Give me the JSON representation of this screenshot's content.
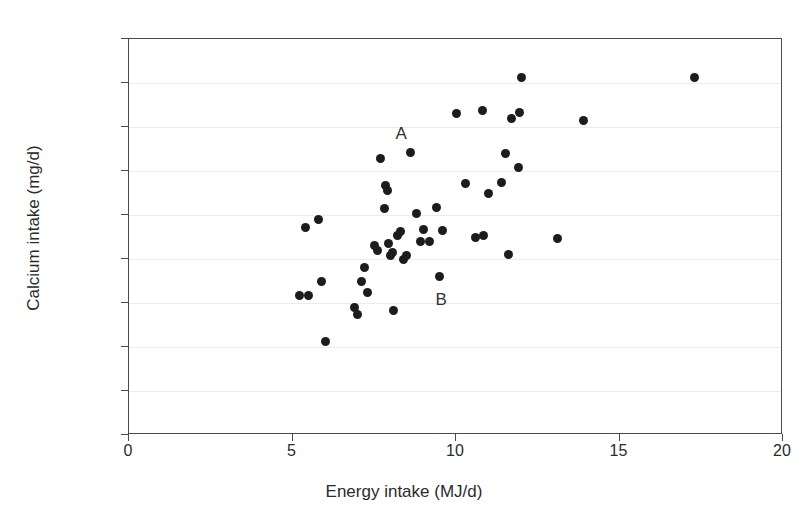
{
  "chart_data": {
    "type": "scatter",
    "title": "",
    "xlabel": "Energy intake (MJ/d)",
    "ylabel": "Calcium intake (mg/d)",
    "xlim": [
      0,
      20
    ],
    "ylim": [
      0,
      1800
    ],
    "xticks": [
      0,
      5,
      10,
      15,
      20
    ],
    "yticks": [
      0,
      200,
      400,
      600,
      800,
      1000,
      1200,
      1400,
      1600,
      1800
    ],
    "grid": "horizontal",
    "legend": "none",
    "marker": "filled-circle",
    "marker_color": "#1c1c1c",
    "points": [
      {
        "x": 5.2,
        "y": 635
      },
      {
        "x": 5.4,
        "y": 945
      },
      {
        "x": 5.5,
        "y": 635
      },
      {
        "x": 5.8,
        "y": 980
      },
      {
        "x": 5.9,
        "y": 700
      },
      {
        "x": 6.0,
        "y": 425
      },
      {
        "x": 6.9,
        "y": 580
      },
      {
        "x": 7.0,
        "y": 550
      },
      {
        "x": 7.1,
        "y": 700
      },
      {
        "x": 7.2,
        "y": 760
      },
      {
        "x": 7.3,
        "y": 650
      },
      {
        "x": 7.5,
        "y": 860
      },
      {
        "x": 7.6,
        "y": 840
      },
      {
        "x": 7.7,
        "y": 1255
      },
      {
        "x": 7.8,
        "y": 1030
      },
      {
        "x": 7.85,
        "y": 1135
      },
      {
        "x": 7.9,
        "y": 1110
      },
      {
        "x": 7.95,
        "y": 870
      },
      {
        "x": 8.0,
        "y": 815
      },
      {
        "x": 8.05,
        "y": 830
      },
      {
        "x": 8.1,
        "y": 565
      },
      {
        "x": 8.2,
        "y": 905
      },
      {
        "x": 8.3,
        "y": 925
      },
      {
        "x": 8.4,
        "y": 800
      },
      {
        "x": 8.5,
        "y": 815
      },
      {
        "x": 8.6,
        "y": 1285
      },
      {
        "x": 8.8,
        "y": 1005
      },
      {
        "x": 8.9,
        "y": 880
      },
      {
        "x": 9.0,
        "y": 935
      },
      {
        "x": 9.2,
        "y": 880
      },
      {
        "x": 9.4,
        "y": 1035
      },
      {
        "x": 9.5,
        "y": 720
      },
      {
        "x": 9.6,
        "y": 930
      },
      {
        "x": 10.0,
        "y": 1460
      },
      {
        "x": 10.3,
        "y": 1145
      },
      {
        "x": 10.6,
        "y": 900
      },
      {
        "x": 10.8,
        "y": 1475
      },
      {
        "x": 10.85,
        "y": 905
      },
      {
        "x": 11.0,
        "y": 1100
      },
      {
        "x": 11.4,
        "y": 1150
      },
      {
        "x": 11.5,
        "y": 1280
      },
      {
        "x": 11.6,
        "y": 820
      },
      {
        "x": 11.7,
        "y": 1440
      },
      {
        "x": 11.9,
        "y": 1215
      },
      {
        "x": 11.95,
        "y": 1465
      },
      {
        "x": 12.0,
        "y": 1625
      },
      {
        "x": 13.1,
        "y": 895
      },
      {
        "x": 13.9,
        "y": 1430
      },
      {
        "x": 17.3,
        "y": 1625
      }
    ],
    "annotations": [
      {
        "label": "A",
        "x": 8.32,
        "y": 1370,
        "point_x": 8.6,
        "point_y": 1285
      },
      {
        "label": "B",
        "x": 9.55,
        "y": 615,
        "point_x": 9.5,
        "point_y": 720
      }
    ]
  }
}
